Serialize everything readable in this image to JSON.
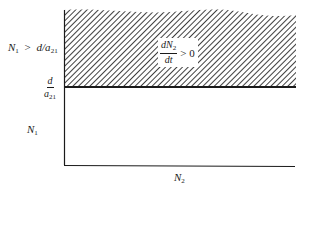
{
  "diagram": {
    "type": "phase-plane-region",
    "x_axis": {
      "label": "N",
      "label_sub": "2"
    },
    "y_axis": {
      "label": "N",
      "label_sub": "1"
    },
    "threshold": {
      "numerator": "d",
      "denominator": "a",
      "denominator_sub": "21"
    },
    "region_condition": {
      "lhs": "N",
      "lhs_sub": "1",
      "op": ">",
      "rhs": "d/a",
      "rhs_sub": "21"
    },
    "annotation": {
      "numerator": "dN",
      "numerator_sub": "2",
      "denominator": "dt",
      "relation": "> 0"
    },
    "colors": {
      "ink": "#1a1a1a",
      "background": "#ffffff",
      "hatch": "#2a2a2a"
    }
  }
}
